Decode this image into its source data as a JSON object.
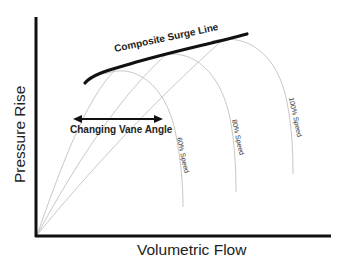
{
  "diagram": {
    "x_axis_label": "Volumetric Flow",
    "y_axis_label": "Pressure Rise",
    "surge_line_label": "Composite Surge Line",
    "arrow_label": "Changing Vane Angle",
    "speed_curves": [
      {
        "label": "60% Speed"
      },
      {
        "label": "80% Speed"
      },
      {
        "label": "100% Speed"
      }
    ],
    "colors": {
      "axis": "#111111",
      "surge_line": "#111111",
      "speed_curves": "#c8c8c8",
      "background": "#ffffff"
    }
  }
}
